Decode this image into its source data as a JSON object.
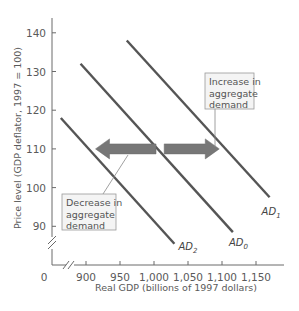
{
  "chart_data": {
    "type": "line",
    "title": "",
    "xlabel": "Real GDP (billions of 1997 dollars)",
    "ylabel": "Price level (GDP deflator, 1997 = 100)",
    "xlim": [
      850,
      1180
    ],
    "ylim": [
      80,
      145
    ],
    "x_origin_label": "0",
    "x_ticks": [
      900,
      950,
      1000,
      1050,
      1100,
      1150
    ],
    "x_tick_labels": [
      "900",
      "950",
      "1,000",
      "1,050",
      "1,100",
      "1,150"
    ],
    "y_ticks": [
      90,
      100,
      110,
      120,
      130,
      140
    ],
    "y_tick_labels": [
      "90",
      "100",
      "110",
      "120",
      "130",
      "140"
    ],
    "axis_breaks": true,
    "grid": false,
    "series": [
      {
        "name": "AD2",
        "label_main": "AD",
        "label_sub": "2",
        "color": "#555555",
        "points": [
          [
            863,
            118
          ],
          [
            1030,
            85.5
          ]
        ]
      },
      {
        "name": "AD0",
        "label_main": "AD",
        "label_sub": "0",
        "color": "#555555",
        "points": [
          [
            892,
            132
          ],
          [
            1116,
            88.5
          ]
        ]
      },
      {
        "name": "AD1",
        "label_main": "AD",
        "label_sub": "1",
        "color": "#555555",
        "points": [
          [
            960,
            138
          ],
          [
            1170,
            97.5
          ]
        ]
      }
    ],
    "annotations": [
      {
        "type": "arrow",
        "direction": "left",
        "from": [
          1003,
          110
        ],
        "to": [
          914,
          110
        ],
        "color": "#777777"
      },
      {
        "type": "arrow",
        "direction": "right",
        "from": [
          1015,
          110
        ],
        "to": [
          1096,
          110
        ],
        "color": "#777777"
      },
      {
        "type": "callout",
        "lines": [
          "Increase in",
          "aggregate",
          "demand"
        ],
        "points_to": [
          1080,
          110
        ]
      },
      {
        "type": "callout",
        "lines": [
          "Decrease in",
          "aggregate",
          "demand"
        ],
        "points_to": [
          970,
          110
        ]
      }
    ]
  },
  "labels": {
    "increase": [
      "Increase in",
      "aggregate",
      "demand"
    ],
    "decrease": [
      "Decrease in",
      "aggregate",
      "demand"
    ]
  }
}
